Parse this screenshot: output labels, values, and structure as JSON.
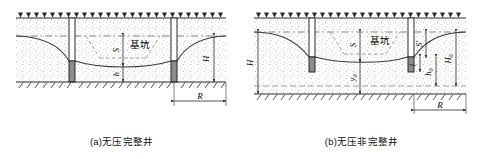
{
  "figure": {
    "title_a": "(a)无压完整井",
    "title_b": "(b)无压非完整井"
  },
  "diagram_a": {
    "name": "unconfined-complete-well",
    "pit_label": "基坑",
    "labels": {
      "drawdown": "S",
      "water_depth": "h",
      "aquifer_thickness": "H",
      "influence_radius": "R"
    },
    "colors": {
      "soil_stipple": "#9a9a9a",
      "line": "#2b2b2b",
      "well_screen": "#8c8c8c",
      "dash": "#777777",
      "water_table": "#444444"
    }
  },
  "diagram_b": {
    "name": "unconfined-incomplete-well",
    "pit_label": "基坑",
    "labels": {
      "aquifer_thickness": "H",
      "drawdown": "S",
      "drawdown_prime": "S'",
      "depth_y0": "y",
      "depth_y0_sub": "0",
      "screen_length": "l",
      "water_depth_h0": "h",
      "water_depth_h0_sub": "0",
      "active_depth_H0": "H",
      "active_depth_H0_sub": "0",
      "influence_radius": "R"
    },
    "colors": {
      "soil_stipple": "#9a9a9a",
      "line": "#2b2b2b",
      "well_screen": "#8c8c8c",
      "dash": "#777777",
      "water_table": "#444444"
    }
  }
}
